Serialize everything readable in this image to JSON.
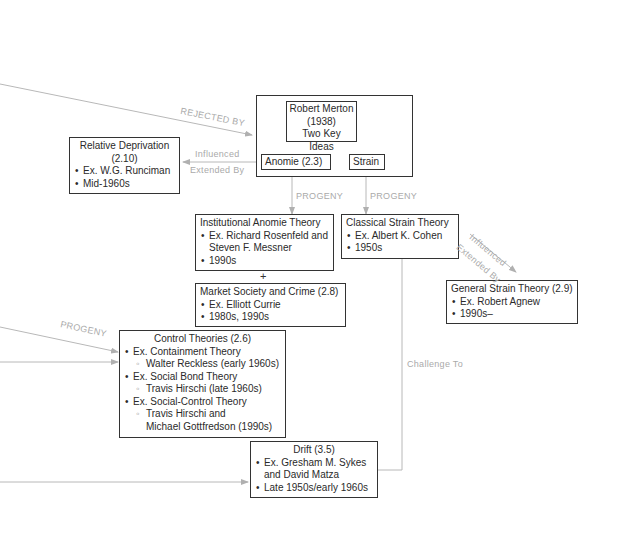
{
  "merton": {
    "title_lines": [
      "Robert Merton",
      "(1938)",
      "Two Key Ideas"
    ],
    "anomie": "Anomie (2.3)",
    "strain": "Strain"
  },
  "relative_deprivation": {
    "title_lines": [
      "Relative Deprivation",
      "(2.10)"
    ],
    "bullets": [
      "Ex. W.G. Runciman",
      "Mid-1960s"
    ]
  },
  "institutional_anomie": {
    "title": "Institutional Anomie Theory",
    "bullets": [
      "Ex. Richard Rosenfeld and",
      "Steven F. Messner",
      "1990s"
    ]
  },
  "plus_sign": "+",
  "market_society": {
    "title": "Market Society and Crime (2.8)",
    "bullets": [
      "Ex. Elliott Currie",
      "1980s, 1990s"
    ]
  },
  "classical_strain": {
    "title": "Classical Strain Theory",
    "bullets": [
      "Ex. Albert K. Cohen",
      "1950s"
    ]
  },
  "general_strain": {
    "title": "General Strain Theory (2.9)",
    "bullets": [
      "Ex. Robert Agnew",
      "1990s–"
    ]
  },
  "control_theories": {
    "title": "Control Theories (2.6)",
    "items": [
      {
        "bullet": "Ex. Containment Theory",
        "sub": [
          "Walter Reckless (early 1960s)"
        ]
      },
      {
        "bullet": "Ex. Social Bond Theory",
        "sub": [
          "Travis Hirschi (late 1960s)"
        ]
      },
      {
        "bullet": "Ex. Social-Control Theory",
        "sub": [
          "Travis Hirschi and",
          "Michael Gottfredson (1990s)"
        ]
      }
    ]
  },
  "drift": {
    "title": "Drift (3.5)",
    "bullets": [
      "Ex. Gresham M. Sykes",
      "and David Matza",
      "Late 1950s/early 1960s"
    ]
  },
  "edge_labels": {
    "rejected_by": "REJECTED BY",
    "influenced": "Influenced",
    "extended_by": "Extended  By",
    "progeny_anomie": "PROGENY",
    "progeny_strain": "PROGENY",
    "influenced_gst": "Influenced",
    "extended_by_gst": "Extended  By",
    "progeny_control": "PROGENY",
    "challenge_to": "Challenge To"
  },
  "colors": {
    "line": "#b0b0b0",
    "box_border": "#333333",
    "label": "#aaaaaa"
  }
}
